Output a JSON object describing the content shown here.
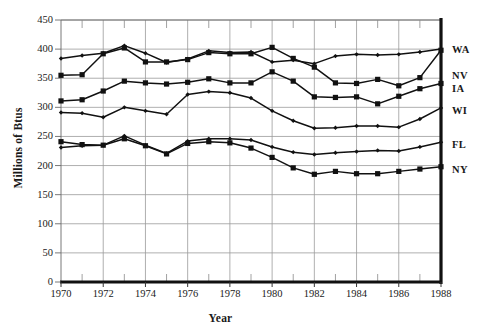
{
  "chart_data": {
    "type": "line",
    "title": "",
    "xlabel": "Year",
    "ylabel": "Millions of Btus",
    "xlim": [
      1970,
      1988
    ],
    "ylim": [
      0,
      450
    ],
    "grid": true,
    "legend_position": "right-outside",
    "x_tick_labels": [
      "1970",
      "1972",
      "1974",
      "1976",
      "1978",
      "1980",
      "1982",
      "1984",
      "1986",
      "1988"
    ],
    "x_tick_values": [
      1970,
      1972,
      1974,
      1976,
      1978,
      1980,
      1982,
      1984,
      1986,
      1988
    ],
    "x_minor_ticks_every": 1,
    "y_tick_labels": [
      "0",
      "50",
      "100",
      "150",
      "200",
      "250",
      "300",
      "350",
      "400",
      "450"
    ],
    "y_tick_values": [
      0,
      50,
      100,
      150,
      200,
      250,
      300,
      350,
      400,
      450
    ],
    "x": [
      1970,
      1971,
      1972,
      1973,
      1974,
      1975,
      1976,
      1977,
      1978,
      1979,
      1980,
      1981,
      1982,
      1983,
      1984,
      1985,
      1986,
      1987,
      1988
    ],
    "series": [
      {
        "name": "WA",
        "marker": "diamond",
        "values": [
          384,
          389,
          393,
          406,
          393,
          377,
          383,
          397,
          394,
          395,
          378,
          381,
          375,
          388,
          391,
          390,
          391,
          395,
          400
        ]
      },
      {
        "name": "NV",
        "marker": "square",
        "values": [
          355,
          356,
          392,
          402,
          378,
          378,
          382,
          394,
          392,
          392,
          403,
          384,
          369,
          342,
          341,
          348,
          337,
          351,
          398
        ]
      },
      {
        "name": "IA",
        "marker": "square",
        "values": [
          311,
          313,
          328,
          345,
          342,
          340,
          343,
          349,
          342,
          342,
          361,
          345,
          318,
          317,
          318,
          306,
          319,
          332,
          341
        ]
      },
      {
        "name": "WI",
        "marker": "diamond",
        "values": [
          291,
          290,
          283,
          300,
          294,
          288,
          322,
          327,
          325,
          316,
          294,
          277,
          264,
          265,
          268,
          268,
          266,
          280,
          299
        ]
      },
      {
        "name": "FL",
        "marker": "diamond",
        "values": [
          231,
          234,
          235,
          251,
          235,
          221,
          242,
          246,
          246,
          244,
          232,
          223,
          219,
          222,
          224,
          226,
          225,
          232,
          240
        ]
      },
      {
        "name": "NY",
        "marker": "square",
        "values": [
          241,
          236,
          235,
          246,
          234,
          220,
          238,
          241,
          239,
          230,
          214,
          196,
          185,
          190,
          186,
          186,
          190,
          194,
          198
        ]
      }
    ]
  },
  "header": {
    "top_faint_text": ""
  }
}
